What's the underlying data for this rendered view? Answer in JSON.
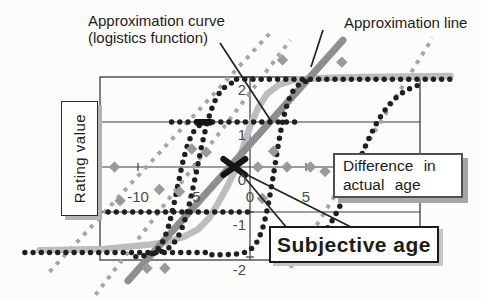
{
  "figure": {
    "annotations": {
      "curve_label_line1": "Approximation curve",
      "curve_label_line2": "(logistics function)",
      "line_label": "Approximation line"
    },
    "axis": {
      "y_title": "Rating value"
    },
    "callout_boxes": {
      "difference": {
        "line1": "Difference in",
        "line2": "actual age"
      },
      "subjective": {
        "text": "Subjective age"
      }
    }
  },
  "chart_data": {
    "type": "scatter",
    "title": "",
    "xlabel": "Difference in actual age",
    "ylabel": "Rating value",
    "xlim": [
      -13.4,
      15.2
    ],
    "ylim": [
      -2.05,
      2.0
    ],
    "x_ticks": [
      -10,
      -5,
      0,
      5,
      10
    ],
    "y_ticks": [
      2,
      1,
      0,
      -1,
      -2
    ],
    "y_gridlines": [
      1,
      0,
      -1
    ],
    "grid": "horizontal-on",
    "legend": "none",
    "palette": {
      "dot_black": "#1f1f1f",
      "dash_gray": "#a6a6a6",
      "line_gray": "#8e8e8e",
      "curve_gray": "#bdbdbd",
      "diamond_gray": "#9a9a9a",
      "axis": "#3c3c3c",
      "tick_text": "#4c4c4c",
      "marker_black": "#151515"
    },
    "dotted_series": [
      {
        "name": "lower-asymptote-row",
        "type": "flat",
        "y": -1.9,
        "x_from": -20.1,
        "x_to": -3.3
      },
      {
        "name": "upper-asymptote-row",
        "type": "flat",
        "y": 1.95,
        "x_from": -1.2,
        "x_to": 17.9
      },
      {
        "name": "rating-plus1-row",
        "type": "flat",
        "y": 1.0,
        "x_from": -7.0,
        "x_to": 4.0
      },
      {
        "name": "rating-minus1-row",
        "type": "flat",
        "y": -1.0,
        "x_from": -13.4,
        "x_to": 0.0
      },
      {
        "name": "steep-left-curve",
        "type": "logistic",
        "x0": -4.7,
        "k": 1.25,
        "ymin": -1.95,
        "ymax": 1.95,
        "x_from": -8.6,
        "x_to": -1.0
      },
      {
        "name": "center-curve",
        "type": "logistic",
        "x0": 2.2,
        "k": 1.6,
        "ymin": -1.95,
        "ymax": 1.95,
        "x_from": -3.4,
        "x_to": 5.2
      },
      {
        "name": "left-mid-curve",
        "type": "logistic",
        "x0": -6.5,
        "k": 1.6,
        "ymin": -2.0,
        "ymax": 1.05,
        "x_from": -10.2,
        "x_to": -3.8
      },
      {
        "name": "right-curve",
        "type": "logistic",
        "x0": 9.4,
        "k": 0.6,
        "ymin": -2.1,
        "ymax": 1.95,
        "x_from": 3.5,
        "x_to": 15.5
      }
    ],
    "dashed_lines": [
      {
        "name": "dashed-line-left",
        "from": [
          -17.9,
          -2.33
        ],
        "to": [
          1.8,
          2.98
        ]
      },
      {
        "name": "dashed-line-middle",
        "from": [
          -13.8,
          -2.84
        ],
        "to": [
          3.6,
          2.82
        ]
      },
      {
        "name": "dashed-line-right",
        "from": [
          3.6,
          -2.24
        ],
        "to": [
          16.3,
          2.87
        ]
      }
    ],
    "approximation_line": {
      "from": [
        -10.9,
        -2.53
      ],
      "to": [
        8.3,
        2.82
      ]
    },
    "approximation_curve": [
      [
        -18.8,
        -1.85
      ],
      [
        -13,
        -1.82
      ],
      [
        -9.1,
        -1.73
      ],
      [
        -7.3,
        -1.66
      ],
      [
        -5.9,
        -1.55
      ],
      [
        -4.6,
        -1.38
      ],
      [
        -3.6,
        -1.12
      ],
      [
        -2.8,
        -0.78
      ],
      [
        -2.0,
        -0.42
      ],
      [
        -1.2,
        0.0
      ],
      [
        -0.6,
        0.45
      ],
      [
        0.0,
        0.9
      ],
      [
        0.7,
        1.3
      ],
      [
        1.5,
        1.62
      ],
      [
        2.6,
        1.83
      ],
      [
        4.0,
        1.94
      ],
      [
        6.5,
        1.98
      ],
      [
        10.0,
        2.0
      ],
      [
        17.9,
        2.02
      ]
    ],
    "diamonds": [
      [
        2.9,
        2.38
      ],
      [
        8.2,
        2.33
      ],
      [
        -5.2,
        0.4
      ],
      [
        -3.9,
        0.33
      ],
      [
        -12.1,
        0.0
      ],
      [
        -8.1,
        -0.5
      ],
      [
        -6.3,
        -0.55
      ],
      [
        -11.6,
        -0.75
      ],
      [
        -9.2,
        -2.25
      ],
      [
        -7.6,
        -2.25
      ],
      [
        0.7,
        0.0
      ],
      [
        2.1,
        0.35
      ],
      [
        3.3,
        0.0
      ],
      [
        5.4,
        0.0
      ],
      [
        6.7,
        -0.1
      ],
      [
        8.75,
        0.0
      ],
      [
        1.1,
        -0.7
      ]
    ],
    "markers": {
      "subjective_age_point": {
        "x": -1.4,
        "y": 0.0
      },
      "bar_marker": {
        "x": -4.9,
        "y": 1.0,
        "w": 1.5
      }
    }
  }
}
